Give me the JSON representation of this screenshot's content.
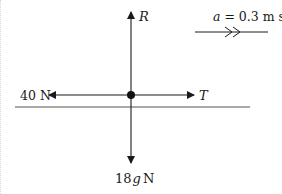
{
  "diagram": {
    "type": "free-body force diagram",
    "forces": {
      "up": {
        "label": "R"
      },
      "left": {
        "label": "40 N"
      },
      "right": {
        "label": "T"
      },
      "down": {
        "label_prefix": "18",
        "label_var": "g",
        "label_unit": "N"
      }
    },
    "acceleration": {
      "var": "a",
      "equals": " = 0.3 m s",
      "exponent": "-2",
      "direction": "right"
    },
    "colors": {
      "line": "#1a1a1a",
      "ground": "#555555",
      "background": "#ffffff"
    }
  }
}
